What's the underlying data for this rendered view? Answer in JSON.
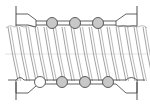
{
  "diagram": {
    "colors": {
      "line": "#3a3a3a",
      "thread": "#8a8a8a",
      "ball_fill": "#c8c8c8",
      "ball_empty": "#ffffff",
      "background": "#ffffff"
    },
    "top_balls": {
      "count": 3,
      "filled": [
        true,
        true,
        true
      ]
    },
    "bottom_balls": {
      "count": 4,
      "filled": [
        false,
        true,
        true,
        true
      ]
    },
    "thread_count": 16
  }
}
